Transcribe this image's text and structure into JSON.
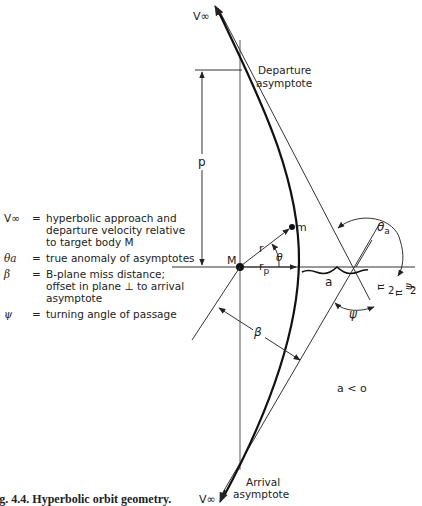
{
  "figure": {
    "caption": "ig. 4.4.  Hyperbolic orbit geometry.",
    "labels": {
      "v_inf_top": "V∞",
      "v_inf_bottom": "V∞",
      "departure_asymptote": [
        "Departure",
        "asymptote"
      ],
      "arrival_asymptote": [
        "Arrival",
        "asymptote"
      ],
      "p": "p",
      "M": "M",
      "m": "m",
      "r": "r",
      "rp": "r",
      "rp_sub": "p",
      "theta": "θ",
      "theta_a": "θ",
      "theta_a_sub": "a",
      "a": "a",
      "beta": "β",
      "psi": "ψ",
      "pi_over_2": "π",
      "two": "2",
      "minus": "-",
      "psi_over_2": "ψ",
      "a_less_o": "a < o"
    }
  },
  "legend": [
    {
      "symbol": "V∞",
      "equals": "=",
      "text": "hyperbolic approach and departure velocity relative to target body M"
    },
    {
      "symbol": "θa",
      "equals": "=",
      "text": "true anomaly of asymptotes"
    },
    {
      "symbol": "β",
      "equals": "=",
      "text": "B-plane miss distance; offset in plane ⊥ to arrival asymptote"
    },
    {
      "symbol": "ψ",
      "equals": "=",
      "text": "turning angle of passage"
    }
  ]
}
